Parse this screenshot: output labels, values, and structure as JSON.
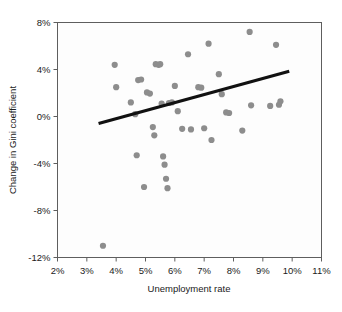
{
  "chart_data": {
    "type": "scatter",
    "title": "",
    "xlabel": "Unemployment rate",
    "ylabel": "Change in Gini coefficient",
    "xlim": [
      2,
      11
    ],
    "ylim": [
      -12,
      8
    ],
    "xticks": [
      "2%",
      "3%",
      "4%",
      "5%",
      "6%",
      "7%",
      "8%",
      "9%",
      "10%",
      "11%"
    ],
    "xtick_values": [
      2,
      3,
      4,
      5,
      6,
      7,
      8,
      9,
      10,
      11
    ],
    "yticks": [
      "8%",
      "4%",
      "0%",
      "-4%",
      "-8%",
      "-12%"
    ],
    "ytick_values": [
      8,
      4,
      0,
      -4,
      -8,
      -12
    ],
    "grid": false,
    "legend": false,
    "point_color": "#8d8d8d",
    "trendline_color": "#111111",
    "points": [
      {
        "x": 3.55,
        "y": -11.0
      },
      {
        "x": 3.95,
        "y": 4.4
      },
      {
        "x": 4.0,
        "y": 2.5
      },
      {
        "x": 4.5,
        "y": 1.2
      },
      {
        "x": 4.65,
        "y": 0.2
      },
      {
        "x": 4.7,
        "y": -3.3
      },
      {
        "x": 4.75,
        "y": 3.1
      },
      {
        "x": 4.85,
        "y": 3.15
      },
      {
        "x": 4.95,
        "y": -6.0
      },
      {
        "x": 5.05,
        "y": 2.05
      },
      {
        "x": 5.15,
        "y": 1.95
      },
      {
        "x": 5.25,
        "y": -0.9
      },
      {
        "x": 5.3,
        "y": -1.6
      },
      {
        "x": 5.35,
        "y": 4.45
      },
      {
        "x": 5.45,
        "y": 4.4
      },
      {
        "x": 5.5,
        "y": 4.45
      },
      {
        "x": 5.55,
        "y": 1.1
      },
      {
        "x": 5.6,
        "y": -3.4
      },
      {
        "x": 5.65,
        "y": -4.1
      },
      {
        "x": 5.7,
        "y": -5.3
      },
      {
        "x": 5.75,
        "y": -6.1
      },
      {
        "x": 5.8,
        "y": 1.15
      },
      {
        "x": 5.9,
        "y": 1.2
      },
      {
        "x": 6.0,
        "y": 2.6
      },
      {
        "x": 6.1,
        "y": 0.45
      },
      {
        "x": 6.25,
        "y": -1.05
      },
      {
        "x": 6.45,
        "y": 5.3
      },
      {
        "x": 6.55,
        "y": -1.1
      },
      {
        "x": 6.8,
        "y": 2.5
      },
      {
        "x": 6.9,
        "y": 2.45
      },
      {
        "x": 7.0,
        "y": -1.0
      },
      {
        "x": 7.15,
        "y": 6.2
      },
      {
        "x": 7.25,
        "y": -2.0
      },
      {
        "x": 7.5,
        "y": 3.6
      },
      {
        "x": 7.6,
        "y": 1.9
      },
      {
        "x": 7.75,
        "y": 0.35
      },
      {
        "x": 7.85,
        "y": 0.3
      },
      {
        "x": 8.3,
        "y": -1.2
      },
      {
        "x": 8.55,
        "y": 7.2
      },
      {
        "x": 8.6,
        "y": 0.95
      },
      {
        "x": 9.25,
        "y": 0.9
      },
      {
        "x": 9.45,
        "y": 6.1
      },
      {
        "x": 9.55,
        "y": 1.0
      },
      {
        "x": 9.6,
        "y": 1.3
      }
    ],
    "trendline": {
      "x_start": 3.4,
      "y_start": -0.6,
      "x_end": 9.9,
      "y_end": 3.85
    }
  },
  "axes": {
    "x_title": "Unemployment rate",
    "y_title": "Change in Gini coefficient"
  }
}
